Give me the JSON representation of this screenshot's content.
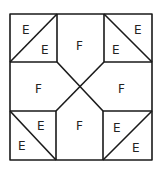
{
  "diagram": {
    "type": "quilt-block",
    "line_color": "#1a1a1a",
    "background": "#ffffff",
    "labels": {
      "tl_outer": "E",
      "tl_inner": "E",
      "top": "F",
      "tr_outer": "E",
      "tr_inner": "E",
      "left": "F",
      "right": "F",
      "bl_inner": "E",
      "bl_outer": "E",
      "bottom": "F",
      "br_inner": "E",
      "br_outer": "E"
    }
  }
}
